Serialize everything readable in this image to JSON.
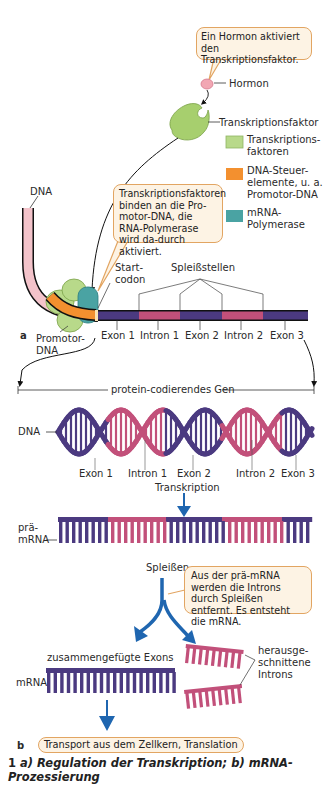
{
  "part_a": {
    "label": "a",
    "bubble_hormone": "Ein Hormon aktiviert den Transkriptionsfaktor.",
    "label_hormone": "Hormon",
    "label_transcription_factor": "Transkriptionsfaktor",
    "legend": [
      {
        "text": "Transkriptions-\nfaktoren",
        "color": "#b8d98a"
      },
      {
        "text": "DNA-Steuer-\nelemente, u. a.\nPromotor-DNA",
        "color": "#f3902f"
      },
      {
        "text": "mRNA-\nPolymerase",
        "color": "#4aa3a3"
      }
    ],
    "label_dna": "DNA",
    "bubble_binding": "Transkriptionsfaktoren binden an die Pro-motor-DNA, die RNA-Polymerase wird da-durch aktiviert.",
    "label_start_codon": "Start-\ncodon",
    "label_splice_sites": "Spleißstellen",
    "label_promoter": "Promotor-\nDNA",
    "segments": [
      "Exon 1",
      "Intron 1",
      "Exon 2",
      "Intron 2",
      "Exon 3"
    ]
  },
  "part_b": {
    "label": "b",
    "gene_label": "protein-codierendes Gen",
    "label_dna": "DNA",
    "segments": [
      "Exon 1",
      "Intron 1",
      "Exon 2",
      "Intron 2",
      "Exon 3"
    ],
    "label_transcription": "Transkription",
    "label_pre_mrna": "prä-\nmRNA",
    "label_splicing": "Spleißen",
    "bubble_splicing": "Aus der prä-mRNA werden die Introns durch Spleißen entfernt. Es entsteht die mRNA.",
    "label_joined_exons": "zusammengefügte Exons",
    "label_mrna": "mRNA",
    "label_excised_introns": "herausge-\nschnittene\nIntrons",
    "transport_label": "Transport aus dem Zellkern, Translation"
  },
  "colors": {
    "exon": "#4b3a80",
    "intron": "#c2507a",
    "arrow_blue": "#1f66b0",
    "bubble_border": "#e2a562",
    "bubble_fill": "#fdf3e4"
  },
  "caption": {
    "number": "1",
    "text": "a) Regulation der Transkription; b) mRNA-Prozessierung"
  }
}
